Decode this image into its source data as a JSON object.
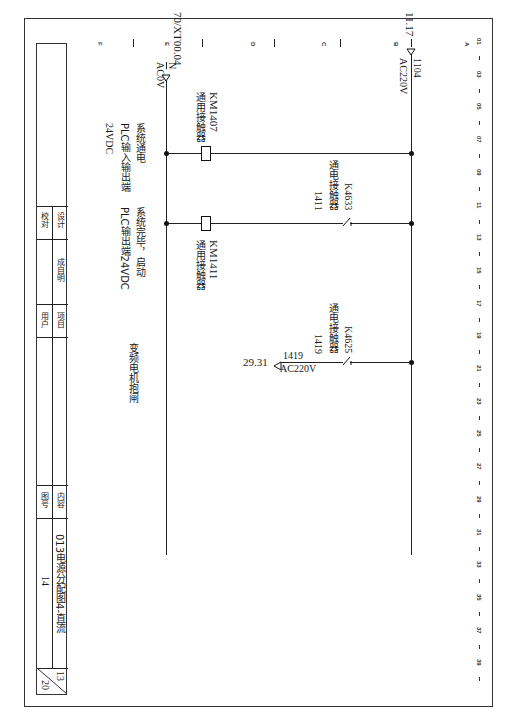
{
  "drawing": {
    "orientation": "rotated-90-clockwise",
    "column_numbers": [
      "01",
      "03",
      "05",
      "07",
      "09",
      "11",
      "13",
      "15",
      "17",
      "19",
      "21",
      "23",
      "25",
      "27",
      "29",
      "31",
      "33",
      "35",
      "37",
      "39"
    ],
    "row_letters": [
      "A",
      "B",
      "C",
      "D",
      "E",
      "F"
    ]
  },
  "circuit": {
    "supply_in": {
      "ref": "11.17",
      "wire": "1104",
      "voltage": "AC220V"
    },
    "neutral": {
      "ref": "70/XT00.04",
      "wire": "N",
      "voltage": "AC0V"
    },
    "rungs": [
      {
        "coil": {
          "tag": "KM1407",
          "desc": "通用接触器"
        },
        "note": [
          "系统通电",
          "PLC输入输出端",
          "24VDC"
        ]
      },
      {
        "contact": {
          "tag": "K4633",
          "desc": "通电接触器",
          "wire": "1411"
        },
        "coil": {
          "tag": "KM1411",
          "desc": "通用接触器"
        },
        "note": [
          "系统完毕，启动",
          "PLC输出端24VDC"
        ]
      },
      {
        "contact": {
          "tag": "K4625",
          "desc": "通电接触器",
          "wire": "1419"
        },
        "output": {
          "ref": "29.31",
          "wire": "1419",
          "voltage": "AC220V"
        },
        "note": [
          "变频电机抱闸"
        ]
      }
    ]
  },
  "title_block": {
    "design_label": "设计",
    "design_value": "成自明",
    "check_label": "校对",
    "project_label": "项目",
    "user_label": "用户",
    "content_label": "内容",
    "content_value": "013电源分配图4-直流",
    "drawing_no_label": "图号",
    "drawing_no_value": "14",
    "sheet": "13",
    "total_sheets": "20"
  }
}
